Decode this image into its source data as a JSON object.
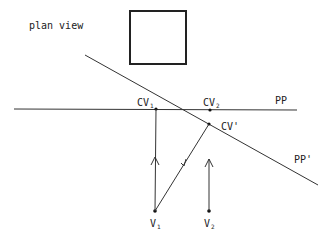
{
  "title": "plan view",
  "labels": {
    "cv1": "CV",
    "cv1_sub": "1",
    "cv2": "CV",
    "cv2_sub": "2",
    "cvprime": "CV'",
    "pp": "PP",
    "ppprime": "PP'",
    "v1": "V",
    "v1_sub": "1",
    "v2": "V",
    "v2_sub": "2"
  },
  "colors": {
    "ink": "#222222",
    "background": "#ffffff"
  }
}
